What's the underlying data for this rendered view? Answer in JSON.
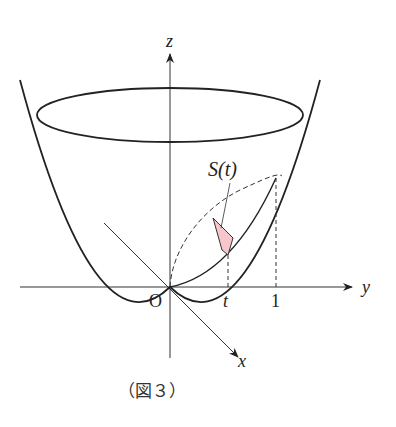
{
  "figure": {
    "caption": "（図３）",
    "labels": {
      "z_axis": "z",
      "y_axis": "y",
      "x_axis": "x",
      "origin": "O",
      "t_mark": "t",
      "one_mark": "1",
      "area": "S(t)"
    },
    "colors": {
      "stroke": "#222222",
      "axis": "#333333",
      "region_fill": "#f7c5cc",
      "region_stroke": "#333333"
    }
  }
}
